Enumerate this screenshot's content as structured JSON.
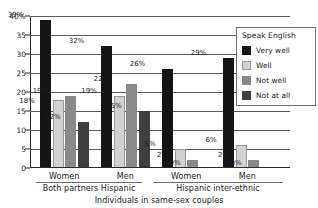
{
  "chart_data": {
    "type": "bar",
    "title": "",
    "xlabel": "Individuals in same-sex couples",
    "ylabel": "",
    "ylim": [
      0,
      40
    ],
    "grid": true,
    "legend_position": "top-right",
    "legend_title": "Speak English",
    "categories": [
      "Women",
      "Men",
      "Women",
      "Men"
    ],
    "group_labels": [
      "Both partners Hispanic",
      "Hispanic inter-ethnic"
    ],
    "yticks": [
      "40%",
      "35",
      "30",
      "25",
      "20",
      "15",
      "10",
      "5",
      "0"
    ],
    "ytick_values": [
      40,
      35,
      30,
      25,
      20,
      15,
      10,
      5,
      0
    ],
    "series": [
      {
        "name": "Very well",
        "color": "#141414",
        "values": [
          39,
          32,
          26,
          29
        ]
      },
      {
        "name": "Well",
        "color": "#d2d2d2",
        "values": [
          18,
          19,
          5,
          6
        ]
      },
      {
        "name": "Not well",
        "color": "#8a8a8a",
        "values": [
          19,
          22,
          2,
          2
        ]
      },
      {
        "name": "Not at all",
        "color": "#3f3f3f",
        "values": [
          12,
          15,
          0,
          0
        ]
      }
    ],
    "data_labels": [
      [
        "39%",
        "18%",
        "19%",
        "12%"
      ],
      [
        "32%",
        "19%",
        "22%",
        "15%"
      ],
      [
        "26%",
        "5%",
        "2%",
        "0%"
      ],
      [
        "29%",
        "6%",
        "2%",
        "0%"
      ]
    ]
  },
  "legend": {
    "title": "Speak English",
    "items": [
      {
        "label": "Very well"
      },
      {
        "label": "Well"
      },
      {
        "label": "Not well"
      },
      {
        "label": "Not at all"
      }
    ]
  },
  "axis": {
    "x_title": "Individuals in same-sex couples",
    "group_left": "Both partners Hispanic",
    "group_right": "Hispanic inter-ethnic",
    "cat_1": "Women",
    "cat_2": "Men",
    "cat_3": "Women",
    "cat_4": "Men"
  }
}
